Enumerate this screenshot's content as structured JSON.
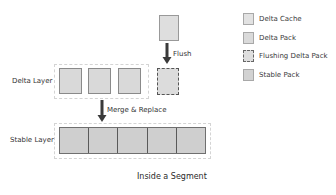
{
  "diagram": {
    "title": "Inside a Segment",
    "layers": {
      "delta": {
        "label": "Delta Layer",
        "pack_count": 3
      },
      "stable": {
        "label": "Stable Layer",
        "pack_count": 5
      }
    },
    "arrows": {
      "flush": {
        "label": "Flush"
      },
      "merge": {
        "label": "Merge & Replace"
      }
    },
    "legend": {
      "items": [
        {
          "label": "Delta Cache",
          "style": "solid-light"
        },
        {
          "label": "Delta Pack",
          "style": "solid"
        },
        {
          "label": "Flushing Delta Pack",
          "style": "dashed"
        },
        {
          "label": "Stable Pack",
          "style": "solid-dark"
        }
      ]
    },
    "colors": {
      "pack_fill": "#d9d9d9",
      "stable_fill": "#cfcfcf",
      "arrow": "#3a3a3a",
      "container_border": "#d4d4d4",
      "dashed_border": "#555555"
    }
  }
}
